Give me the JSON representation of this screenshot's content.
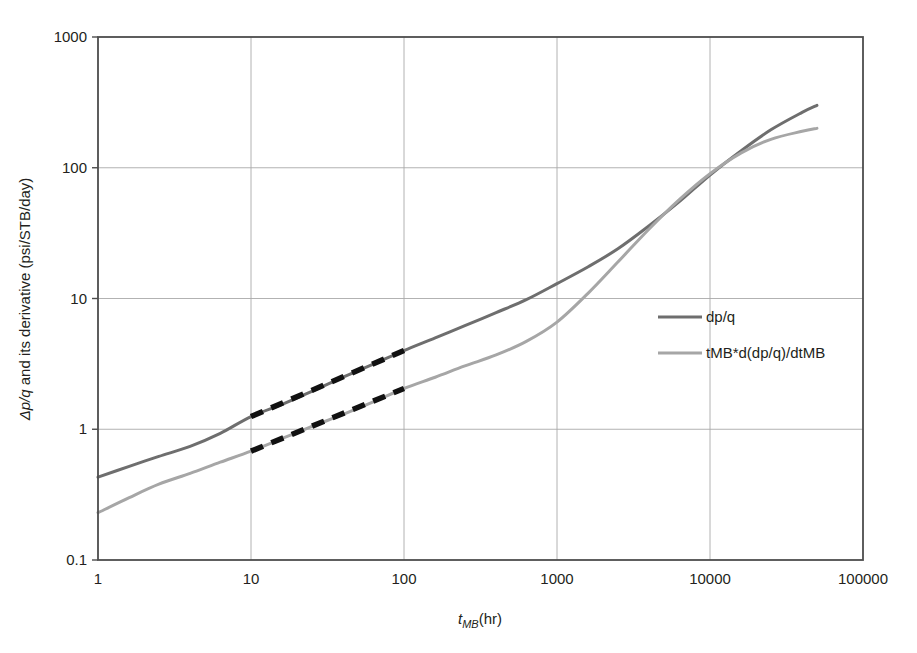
{
  "chart_data": {
    "type": "line",
    "title": "",
    "xlabel": "t_MB (hr)",
    "xlabel_parts": {
      "symbol": "t",
      "subscript": "MB",
      "units": "(hr)"
    },
    "ylabel": "Δp/q and its derivative (psi/STB/day)",
    "ylabel_parts": {
      "symbol": "Δp/q",
      "rest": " and its derivative (psi/STB/day)"
    },
    "xscale": "log",
    "yscale": "log",
    "xlim": [
      1,
      100000
    ],
    "ylim": [
      0.1,
      1000
    ],
    "xticks": [
      "1",
      "10",
      "100",
      "1000",
      "10000",
      "100000"
    ],
    "yticks": [
      "0.1",
      "1",
      "10",
      "100",
      "1000"
    ],
    "grid": true,
    "legend_position": "center-right",
    "series": [
      {
        "name": "dp/q",
        "color": "#6e6e6e",
        "linewidth": 3,
        "x": [
          1,
          1.6,
          2.5,
          4,
          6.3,
          10,
          16,
          25,
          40,
          63,
          100,
          160,
          250,
          400,
          630,
          1000,
          1600,
          2500,
          4000,
          6300,
          10000,
          16000,
          25000,
          40000,
          50000
        ],
        "y": [
          0.43,
          0.52,
          0.62,
          0.74,
          0.93,
          1.25,
          1.55,
          1.95,
          2.5,
          3.15,
          4.0,
          5.0,
          6.2,
          7.8,
          9.8,
          13.0,
          17.5,
          24.0,
          36.0,
          55.0,
          88.0,
          135.0,
          195.0,
          265.0,
          300.0
        ]
      },
      {
        "name": "tMB*d(dp/q)/dtMB",
        "color": "#a6a6a6",
        "linewidth": 3,
        "x": [
          1,
          1.6,
          2.5,
          4,
          6.3,
          10,
          16,
          25,
          40,
          63,
          100,
          160,
          250,
          400,
          630,
          1000,
          1600,
          2500,
          4000,
          6300,
          10000,
          16000,
          25000,
          40000,
          50000
        ],
        "y": [
          0.23,
          0.3,
          0.38,
          0.46,
          0.56,
          0.68,
          0.85,
          1.05,
          1.3,
          1.62,
          2.05,
          2.5,
          3.05,
          3.7,
          4.7,
          6.6,
          11.0,
          19.0,
          34.0,
          57.0,
          90.0,
          130.0,
          165.0,
          190.0,
          200.0
        ]
      }
    ],
    "annotations": [
      {
        "name": "unit-slope-reference-upper",
        "style": "dashed-black",
        "x": [
          10,
          100
        ],
        "y": [
          1.25,
          4.0
        ]
      },
      {
        "name": "unit-slope-reference-lower",
        "style": "dashed-black",
        "x": [
          10,
          100
        ],
        "y": [
          0.68,
          2.05
        ]
      }
    ],
    "legend": [
      {
        "label": "dp/q",
        "color": "#6e6e6e"
      },
      {
        "label": "tMB*d(dp/q)/dtMB",
        "color": "#a6a6a6"
      }
    ]
  },
  "colors": {
    "series_primary": "#6e6e6e",
    "series_secondary": "#a6a6a6",
    "annotation": "#111111",
    "grid": "#a9a9a9",
    "frame": "#4d4d4d",
    "background": "#ffffff",
    "text": "#231f20"
  }
}
